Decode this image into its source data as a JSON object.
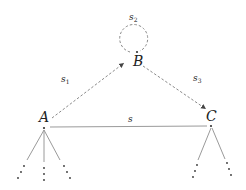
{
  "diagram": {
    "type": "state-transition-graph",
    "colors": {
      "line": "#9a9a9a",
      "dashed": "#8a8a8a",
      "text": "#222222",
      "dot": "#333333"
    },
    "nodes": {
      "A": {
        "label": "A"
      },
      "B": {
        "label": "B"
      },
      "C": {
        "label": "C"
      }
    },
    "edges": {
      "s": {
        "label": "s",
        "sub": "",
        "from": "A",
        "to": "C",
        "style": "solid"
      },
      "s1": {
        "label": "s",
        "sub": "1",
        "from": "A",
        "to": "B",
        "style": "dashed-arrow"
      },
      "s2": {
        "label": "s",
        "sub": "2",
        "from": "B",
        "to": "B",
        "style": "dashed-loop"
      },
      "s3": {
        "label": "s",
        "sub": "3",
        "from": "B",
        "to": "C",
        "style": "dashed-arrow"
      }
    },
    "continuations": {
      "A": 3,
      "C": 2,
      "glyph": "⋮"
    }
  }
}
